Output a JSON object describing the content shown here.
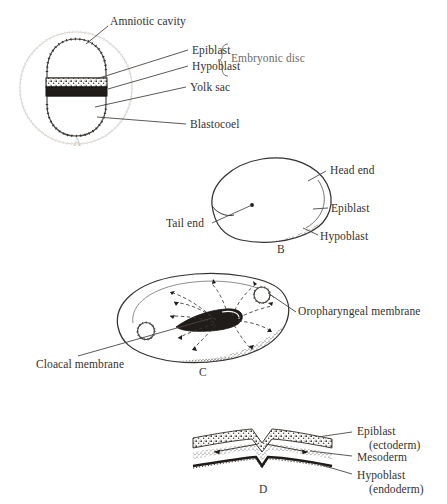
{
  "figure": {
    "background_color": "#ffffff",
    "ink_color": "#35312e"
  },
  "panels": [
    {
      "letter": "A",
      "name": "bilaminar-embryonic-disc-in-blastocyst",
      "labels": [
        {
          "id": "amniotic-cavity",
          "text": "Amniotic cavity"
        },
        {
          "id": "epiblast",
          "text": "Epiblast"
        },
        {
          "id": "hypoblast",
          "text": "Hypoblast"
        },
        {
          "id": "yolk-sac",
          "text": "Yolk sac"
        },
        {
          "id": "blastocoel",
          "text": "Blastocoel"
        },
        {
          "id": "embryonic-disc",
          "text": "Embryonic disc"
        }
      ]
    },
    {
      "letter": "B",
      "name": "bilaminar-disc-dorsal-view",
      "labels": [
        {
          "id": "head-end",
          "text": "Head end"
        },
        {
          "id": "tail-end",
          "text": "Tail end"
        },
        {
          "id": "epiblast",
          "text": "Epiblast"
        },
        {
          "id": "hypoblast",
          "text": "Hypoblast"
        }
      ]
    },
    {
      "letter": "C",
      "name": "gastrulating-disc-with-primitive-streak",
      "labels": [
        {
          "id": "oropharyngeal-membrane",
          "text": "Oropharyngeal membrane"
        },
        {
          "id": "cloacal-membrane",
          "text": "Cloacal membrane"
        }
      ]
    },
    {
      "letter": "D",
      "name": "trilaminar-disc-cross-section",
      "labels": [
        {
          "id": "epiblast",
          "text": "Epiblast",
          "sub": "(ectoderm)"
        },
        {
          "id": "mesoderm",
          "text": "Mesoderm",
          "sub": ""
        },
        {
          "id": "hypoblast",
          "text": "Hypoblast",
          "sub": "(endoderm)"
        }
      ]
    }
  ]
}
